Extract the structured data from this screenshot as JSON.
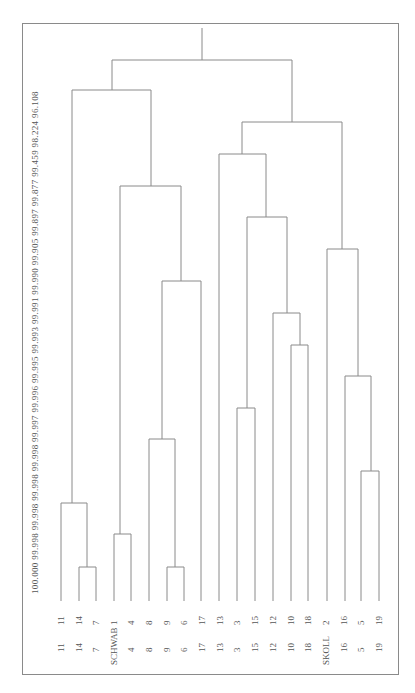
{
  "chart_data": {
    "type": "dendrogram",
    "orientation": "rotated-90",
    "similarity_axis": [
      "100.000",
      "99.998",
      "99.998",
      "99.998",
      "99.998",
      "99.997",
      "99.996",
      "99.995",
      "99.993",
      "99.991",
      "99.990",
      "99.905",
      "99.897",
      "99.877",
      "99.459",
      "98.224",
      "96.108"
    ],
    "leaves_row1": [
      "11",
      "14",
      "7",
      "1",
      "4",
      "8",
      "9",
      "6",
      "17",
      "13",
      "3",
      "15",
      "12",
      "10",
      "18",
      "2",
      "16",
      "5",
      "19"
    ],
    "leaves_row2": [
      "11",
      "14",
      "7",
      "SCHWAB",
      "4",
      "8",
      "9",
      "6",
      "17",
      "13",
      "3",
      "15",
      "12",
      "10",
      "18",
      "SKOLL",
      "16",
      "5",
      "19"
    ],
    "leaf_x": [
      61,
      79,
      96,
      114,
      131,
      149,
      167,
      184,
      202,
      220,
      237,
      255,
      273,
      291,
      308,
      326,
      344,
      361,
      379
    ],
    "merges": [
      {
        "y": 567,
        "x1": 79,
        "x2": 96,
        "mid": 87
      },
      {
        "y": 567,
        "x1": 167,
        "x2": 184,
        "mid": 175
      },
      {
        "y": 534,
        "x1": 114,
        "x2": 131,
        "mid": 120
      },
      {
        "y": 503,
        "x1": 61,
        "x2": 87,
        "mid": 72
      },
      {
        "y": 471,
        "x1": 361,
        "x2": 379,
        "mid": 371
      },
      {
        "y": 439,
        "x1": 149,
        "x2": 175,
        "mid": 162
      },
      {
        "y": 408,
        "x1": 237,
        "x2": 255,
        "mid": 247
      },
      {
        "y": 376,
        "x1": 345,
        "x2": 371,
        "mid": 358
      },
      {
        "y": 345,
        "x1": 291,
        "x2": 308,
        "mid": 300
      },
      {
        "y": 313,
        "x1": 273,
        "x2": 300,
        "mid": 287
      },
      {
        "y": 281,
        "x1": 162,
        "x2": 201,
        "mid": 181
      },
      {
        "y": 249,
        "x1": 327,
        "x2": 358,
        "mid": 342
      },
      {
        "y": 217,
        "x1": 247,
        "x2": 287,
        "mid": 266
      },
      {
        "y": 186,
        "x1": 120,
        "x2": 181,
        "mid": 151
      },
      {
        "y": 154,
        "x1": 219,
        "x2": 266,
        "mid": 242
      },
      {
        "y": 122,
        "x1": 242,
        "x2": 342,
        "mid": 292
      },
      {
        "y": 90,
        "x1": 72,
        "x2": 151,
        "mid": 112
      },
      {
        "y": 60,
        "x1": 112,
        "x2": 292,
        "mid": 202
      }
    ],
    "title": "",
    "line_color": "#8a8a8a"
  }
}
